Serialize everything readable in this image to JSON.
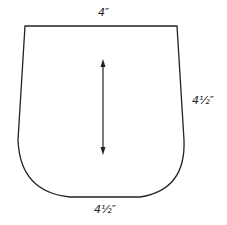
{
  "diagram": {
    "type": "pattern-piece",
    "labels": {
      "top": "4″",
      "right": "4½″",
      "bottom": "4½″"
    },
    "grainline": "double-headed arrow",
    "stroke_color": "#222222"
  }
}
